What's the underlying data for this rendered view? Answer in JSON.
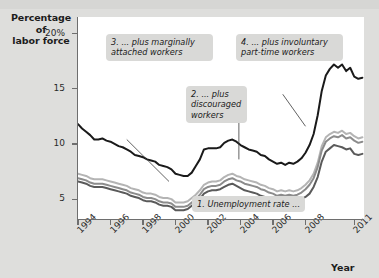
{
  "figure": {
    "y_axis_title_line1": "Percentage of",
    "y_axis_title_line2": "labor force",
    "x_axis_title": "Year"
  },
  "callouts": {
    "c1_line1": "1. Unemployment rate ...",
    "c2_line1": "2. ... plus",
    "c2_line2": "discouraged",
    "c2_line3": "workers",
    "c3_line1": "3. ... plus marginally",
    "c3_line2": "attached workers",
    "c4_line1": "4. ... plus involuntary",
    "c4_line2": "part-time workers"
  },
  "colors": {
    "plot_background": "#ffffff",
    "figure_background": "#dededc",
    "callout_background": "#d9d9d7",
    "series_u6": "#1a1a1a",
    "series_u5": "#b4b4b4",
    "series_u4": "#8c8c8c",
    "series_u3": "#5a5a5a",
    "axis": "#6e6e6e"
  },
  "chart_data": {
    "type": "line",
    "title": "",
    "subtitle": "",
    "xlabel": "Year",
    "ylabel": "Percentage of labor force",
    "xlim": [
      1994,
      2011.6
    ],
    "ylim": [
      3.2,
      21.5
    ],
    "yticks": [
      5,
      10,
      15,
      20
    ],
    "ytick_labels": [
      "5",
      "10",
      "15",
      "20%"
    ],
    "xticks": [
      1994,
      1996,
      1998,
      2000,
      2002,
      2004,
      2006,
      2008,
      2011
    ],
    "xtick_labels": [
      "1994",
      "1996",
      "1998",
      "2000",
      "2002",
      "2004",
      "2006",
      "2008",
      "2011"
    ],
    "grid": false,
    "legend": "annotations",
    "annotations": [
      {
        "id": 1,
        "text": "1. Unemployment rate ...",
        "series": "u3"
      },
      {
        "id": 2,
        "text": "2. ... plus discouraged workers",
        "series": "u4"
      },
      {
        "id": 3,
        "text": "3. ... plus marginally attached workers",
        "series": "u5"
      },
      {
        "id": 4,
        "text": "4. ... plus involuntary part-time workers",
        "series": "u6"
      }
    ],
    "x": [
      1994.0,
      1994.25,
      1994.5,
      1994.75,
      1995.0,
      1995.25,
      1995.5,
      1995.75,
      1996.0,
      1996.25,
      1996.5,
      1996.75,
      1997.0,
      1997.25,
      1997.5,
      1997.75,
      1998.0,
      1998.25,
      1998.5,
      1998.75,
      1999.0,
      1999.25,
      1999.5,
      1999.75,
      2000.0,
      2000.25,
      2000.5,
      2000.75,
      2001.0,
      2001.25,
      2001.5,
      2001.75,
      2002.0,
      2002.25,
      2002.5,
      2002.75,
      2003.0,
      2003.25,
      2003.5,
      2003.75,
      2004.0,
      2004.25,
      2004.5,
      2004.75,
      2005.0,
      2005.25,
      2005.5,
      2005.75,
      2006.0,
      2006.25,
      2006.5,
      2006.75,
      2007.0,
      2007.25,
      2007.5,
      2007.75,
      2008.0,
      2008.25,
      2008.5,
      2008.75,
      2009.0,
      2009.25,
      2009.5,
      2009.75,
      2010.0,
      2010.25,
      2010.5,
      2010.75,
      2011.0,
      2011.25,
      2011.5
    ],
    "series": [
      {
        "name": "4. ... plus involuntary part-time workers (U-6)",
        "key": "u6",
        "color": "#1a1a1a",
        "width": 2.0,
        "values": [
          11.8,
          11.4,
          11.1,
          10.8,
          10.4,
          10.4,
          10.5,
          10.3,
          10.2,
          10.0,
          9.8,
          9.7,
          9.5,
          9.3,
          9.0,
          8.9,
          8.8,
          8.6,
          8.5,
          8.4,
          8.1,
          8.0,
          7.9,
          7.7,
          7.3,
          7.2,
          7.1,
          7.1,
          7.4,
          8.0,
          8.6,
          9.5,
          9.6,
          9.6,
          9.6,
          9.7,
          10.1,
          10.3,
          10.4,
          10.2,
          9.9,
          9.7,
          9.5,
          9.4,
          9.3,
          9.0,
          8.9,
          8.6,
          8.4,
          8.2,
          8.3,
          8.1,
          8.3,
          8.2,
          8.4,
          8.7,
          9.2,
          9.9,
          10.9,
          12.6,
          14.8,
          16.2,
          16.8,
          17.2,
          16.9,
          17.2,
          16.6,
          16.9,
          16.1,
          15.9,
          16.0
        ]
      },
      {
        "name": "3. ... plus marginally attached workers (U-5)",
        "key": "u5",
        "color": "#b4b4b4",
        "width": 2.0,
        "values": [
          7.3,
          7.2,
          7.1,
          6.9,
          6.8,
          6.8,
          6.8,
          6.7,
          6.6,
          6.5,
          6.4,
          6.3,
          6.2,
          6.0,
          5.9,
          5.8,
          5.6,
          5.5,
          5.5,
          5.4,
          5.2,
          5.1,
          5.1,
          5.0,
          4.7,
          4.7,
          4.7,
          4.8,
          5.1,
          5.4,
          5.8,
          6.3,
          6.5,
          6.6,
          6.6,
          6.7,
          7.0,
          7.2,
          7.3,
          7.1,
          7.0,
          6.8,
          6.7,
          6.6,
          6.5,
          6.3,
          6.2,
          6.0,
          5.9,
          5.7,
          5.8,
          5.7,
          5.8,
          5.7,
          5.8,
          6.0,
          6.3,
          6.7,
          7.3,
          8.3,
          9.8,
          10.6,
          10.9,
          11.1,
          11.0,
          11.2,
          10.9,
          11.0,
          10.7,
          10.5,
          10.6
        ]
      },
      {
        "name": "2. ... plus discouraged workers (U-4)",
        "key": "u4",
        "color": "#8c8c8c",
        "width": 2.0,
        "values": [
          6.9,
          6.8,
          6.7,
          6.5,
          6.4,
          6.4,
          6.4,
          6.3,
          6.2,
          6.1,
          6.0,
          5.9,
          5.8,
          5.6,
          5.5,
          5.4,
          5.2,
          5.1,
          5.1,
          5.0,
          4.8,
          4.7,
          4.7,
          4.6,
          4.3,
          4.3,
          4.3,
          4.4,
          4.7,
          5.0,
          5.4,
          5.9,
          6.1,
          6.2,
          6.2,
          6.3,
          6.6,
          6.8,
          6.9,
          6.7,
          6.6,
          6.4,
          6.3,
          6.2,
          6.1,
          5.9,
          5.8,
          5.6,
          5.5,
          5.3,
          5.4,
          5.3,
          5.4,
          5.3,
          5.4,
          5.6,
          5.9,
          6.3,
          6.9,
          7.9,
          9.4,
          10.2,
          10.5,
          10.7,
          10.6,
          10.8,
          10.5,
          10.6,
          10.3,
          10.1,
          10.2
        ]
      },
      {
        "name": "1. Unemployment rate (U-3)",
        "key": "u3",
        "color": "#5a5a5a",
        "width": 2.0,
        "values": [
          6.6,
          6.5,
          6.4,
          6.2,
          6.1,
          6.1,
          6.1,
          6.0,
          5.9,
          5.8,
          5.7,
          5.6,
          5.5,
          5.3,
          5.2,
          5.1,
          4.9,
          4.8,
          4.8,
          4.7,
          4.5,
          4.4,
          4.4,
          4.3,
          4.0,
          4.0,
          4.0,
          4.1,
          4.4,
          4.6,
          5.0,
          5.5,
          5.7,
          5.8,
          5.8,
          5.9,
          6.1,
          6.3,
          6.4,
          6.2,
          6.0,
          5.8,
          5.7,
          5.6,
          5.5,
          5.3,
          5.2,
          5.0,
          4.9,
          4.7,
          4.8,
          4.7,
          4.8,
          4.7,
          4.8,
          5.0,
          5.2,
          5.5,
          6.1,
          7.0,
          8.4,
          9.3,
          9.6,
          9.9,
          9.8,
          9.7,
          9.5,
          9.6,
          9.1,
          9.0,
          9.1
        ]
      }
    ]
  }
}
